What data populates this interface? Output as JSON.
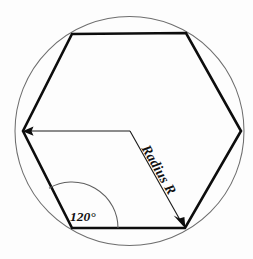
{
  "figure": {
    "background_color": "#fdfdfd",
    "ink_color": "#0d0d0d",
    "circle_color": "#6e6e6e",
    "labels": {
      "radius": "Radius R",
      "interior_angle": "120°"
    },
    "circle": {
      "center_x": 129.5,
      "center_y": 131,
      "radius": 114.5
    },
    "hexagon": {
      "vertices": [
        {
          "name": "top-left",
          "x": 72,
          "y": 34
        },
        {
          "name": "top-right",
          "x": 186,
          "y": 33
        },
        {
          "name": "right",
          "x": 241,
          "y": 131
        },
        {
          "name": "bottom-right",
          "x": 185,
          "y": 228
        },
        {
          "name": "bottom-left",
          "x": 72,
          "y": 228
        },
        {
          "name": "left",
          "x": 23,
          "y": 131
        }
      ],
      "edge_count": 6,
      "interior_angle_degrees": 120
    },
    "radius_dimension": {
      "elbow_x": 130,
      "elbow_y": 131,
      "arrow_left_x": 23,
      "arrow_left_y": 131,
      "arrow_corner_x": 185,
      "arrow_corner_y": 228,
      "label_rotation_degrees": 60
    },
    "angle_arc": {
      "vertex_x": 72,
      "vertex_y": 228,
      "arc_radius": 46,
      "label_x": 86,
      "label_y": 216
    }
  }
}
